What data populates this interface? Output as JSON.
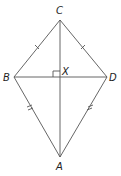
{
  "diagram": {
    "type": "kite",
    "vertices": {
      "C": {
        "label": "C",
        "x": 60,
        "y": 20
      },
      "B": {
        "label": "B",
        "x": 14,
        "y": 77
      },
      "D": {
        "label": "D",
        "x": 107,
        "y": 77
      },
      "A": {
        "label": "A",
        "x": 60,
        "y": 157
      }
    },
    "intersection": {
      "label": "X",
      "x": 60,
      "y": 77
    },
    "right_angle_at": "X",
    "tick_marks": {
      "CB": 1,
      "CD": 1,
      "BA": 2,
      "DA": 2
    },
    "line_color": "#555555"
  }
}
